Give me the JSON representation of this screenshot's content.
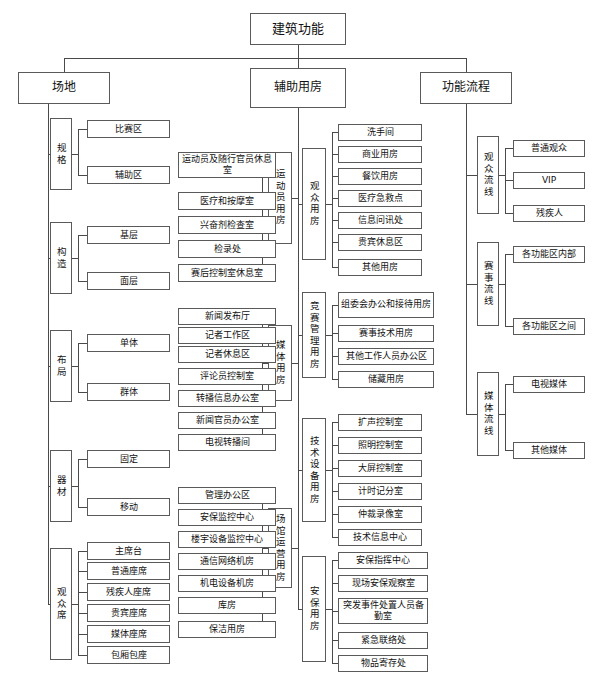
{
  "diagram": {
    "title": "建筑功能",
    "root": {
      "label": "建筑功能"
    },
    "branches": [
      {
        "label": "场地",
        "groups": [
          {
            "label": "规格",
            "items": [
              "比赛区",
              "辅助区"
            ]
          },
          {
            "label": "构造",
            "items": [
              "基层",
              "面层"
            ]
          },
          {
            "label": "布局",
            "items": [
              "单体",
              "群体"
            ]
          },
          {
            "label": "器材",
            "items": [
              "固定",
              "移动"
            ]
          },
          {
            "label": "观众席",
            "items": [
              "主席台",
              "普通座席",
              "残疾人座席",
              "贵宾座席",
              "媒体座席",
              "包厢包座"
            ]
          }
        ]
      },
      {
        "label": "辅助用房",
        "groups": [
          {
            "label": "运动员用房",
            "items": [
              "运动员及随行官员休息室",
              "医疗和按摩室",
              "兴奋剂检查室",
              "检录处",
              "赛后控制室休息室"
            ]
          },
          {
            "label": "媒体用房",
            "items": [
              "新闻发布厅",
              "记者工作区",
              "记者休息区",
              "评论员控制室",
              "转播信息办公室",
              "新闻官员办公室",
              "电视转播间"
            ]
          },
          {
            "label": "场馆运营用房",
            "items": [
              "管理办公区",
              "安保监控中心",
              "楼宇设备监控中心",
              "通信网络机房",
              "机电设备机房",
              "库房",
              "保洁用房"
            ]
          },
          {
            "label": "观众用房",
            "items": [
              "洗手间",
              "商业用房",
              "餐饮用房",
              "医疗急救点",
              "信息问讯处",
              "贵宾休息区",
              "其他用房"
            ]
          },
          {
            "label": "竞赛管理用房",
            "items": [
              "组委会办公和接待用房",
              "赛事技术用房",
              "其他工作人员办公区",
              "储藏用房"
            ]
          },
          {
            "label": "技术设备用房",
            "items": [
              "扩声控制室",
              "照明控制室",
              "大屏控制室",
              "计时记分室",
              "仲裁录像室",
              "技术信息中心"
            ]
          },
          {
            "label": "安保用房",
            "items": [
              "安保指挥中心",
              "现场安保观察室",
              "突发事件处置人员备勤室",
              "紧急联络处",
              "物品寄存处"
            ]
          }
        ]
      },
      {
        "label": "功能流程",
        "groups": [
          {
            "label": "观众流线",
            "items": [
              "普通观众",
              "VIP",
              "残疾人"
            ]
          },
          {
            "label": "赛事流线",
            "items": [
              "各功能区内部",
              "各功能区之间"
            ]
          },
          {
            "label": "媒体流线",
            "items": [
              "电视媒体",
              "其他媒体"
            ]
          }
        ]
      }
    ]
  },
  "colors": {
    "line": "#4a4a4a",
    "border": "#5a5a5a",
    "background": "#ffffff",
    "text": "#111111"
  }
}
